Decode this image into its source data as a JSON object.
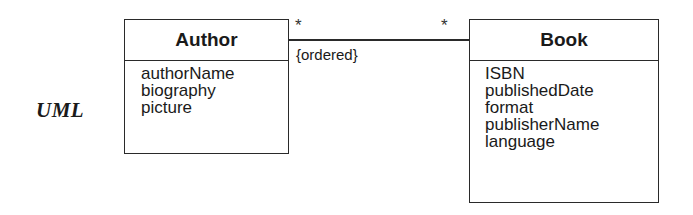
{
  "label": "UML",
  "classes": {
    "author": {
      "name": "Author",
      "attributes": [
        "authorName",
        "biography",
        "picture"
      ]
    },
    "book": {
      "name": "Book",
      "attributes": [
        "ISBN",
        "publishedDate",
        "format",
        "publisherName",
        "language"
      ]
    }
  },
  "association": {
    "multiplicity_author_end": "*",
    "multiplicity_book_end": "*",
    "constraint": "{ordered}"
  }
}
